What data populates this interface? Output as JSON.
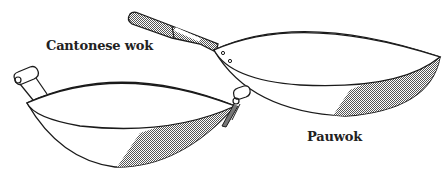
{
  "figure": {
    "labels": {
      "cantonese": "Cantonese wok",
      "pau": "Pauwok"
    },
    "colors": {
      "line": "#1a1a1a",
      "shade": "#9a9a9a",
      "handle_fill": "#8c8c8c",
      "background": "#ffffff"
    }
  }
}
